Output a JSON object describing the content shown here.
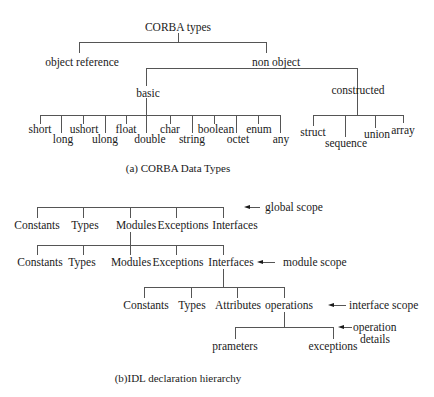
{
  "figure_a": {
    "root": "CORBA types",
    "level1": [
      "object reference",
      "non object"
    ],
    "level2": [
      "basic",
      "constructed"
    ],
    "basic_types": [
      "short",
      "long",
      "ushort",
      "ulong",
      "float",
      "double",
      "char",
      "string",
      "boolean",
      "octet",
      "enum",
      "any"
    ],
    "constructed_types": [
      "struct",
      "sequence",
      "union",
      "array"
    ],
    "caption": "(a) CORBA Data Types"
  },
  "figure_b": {
    "global_scope": {
      "items": [
        "Constants",
        "Types",
        "Modules",
        "Exceptions",
        "Interfaces"
      ],
      "annotation": "global scope"
    },
    "module_scope": {
      "items": [
        "Constants",
        "Types",
        "Modules",
        "Exceptions",
        "Interfaces"
      ],
      "annotation": "module scope"
    },
    "interface_scope": {
      "items": [
        "Constants",
        "Types",
        "Attributes",
        "operations"
      ],
      "annotation": "interface scope"
    },
    "operation_details": {
      "items": [
        "prameters",
        "exceptions"
      ],
      "annotation_line1": "operation",
      "annotation_line2": "details"
    },
    "caption": "(b)IDL declaration hierarchy"
  }
}
